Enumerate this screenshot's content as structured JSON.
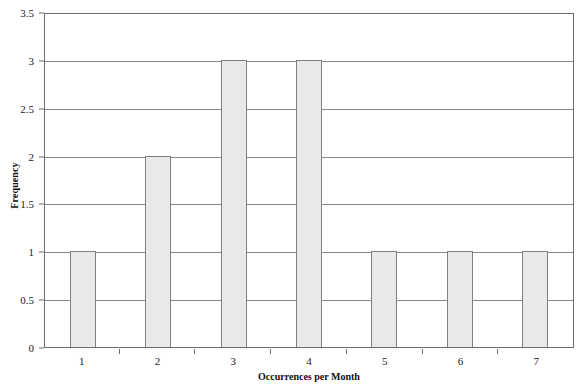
{
  "chart_data": {
    "type": "bar",
    "title": "",
    "xlabel": "Occurrences per Month",
    "ylabel": "Frequency",
    "categories": [
      "1",
      "2",
      "3",
      "4",
      "5",
      "6",
      "7"
    ],
    "values": [
      1,
      2,
      3,
      3,
      1,
      1,
      1
    ],
    "ylim": [
      0,
      3.5
    ],
    "y_ticks": [
      "0",
      "0.5",
      "1",
      "1.5",
      "2",
      "2.5",
      "3",
      "3.5"
    ],
    "y_tick_values": [
      0,
      0.5,
      1,
      1.5,
      2,
      2.5,
      3,
      3.5
    ],
    "grid": "horizontal",
    "legend": "none",
    "colors": {
      "bar_fill": "#e9e9e9",
      "bar_border": "#808080",
      "gridline": "#8a8a8a",
      "axis": "#6e6e6e",
      "text": "#1a1a1a",
      "background": "#ffffff"
    }
  }
}
